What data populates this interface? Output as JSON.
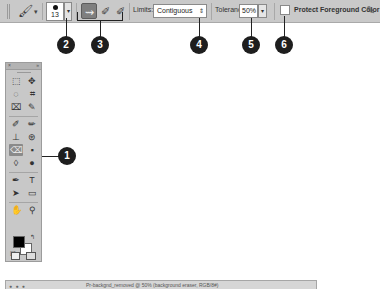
{
  "options_bar": {
    "tool_preset_icon": "background-eraser-icon",
    "tool_preset_arrow": "▾",
    "brush": {
      "size": "13",
      "dropdown": "▾"
    },
    "sampling_buttons": [
      {
        "name": "sampling-continuous",
        "glyph": "⇝",
        "active": true
      },
      {
        "name": "sampling-once",
        "glyph": "✐",
        "active": false
      },
      {
        "name": "sampling-background-swatch",
        "glyph": "✐",
        "active": false
      }
    ],
    "limits_label": "Limits:",
    "limits_value": "Contiguous",
    "limits_arrows": "⇕",
    "tolerance_label": "Tolerance:",
    "tolerance_value": "50%",
    "tolerance_dropdown": "▾",
    "protect_fg_label": "Protect Foreground Color",
    "protect_fg_checked": false,
    "tablet_pressure_icon": "✎"
  },
  "callouts": [
    "1",
    "2",
    "3",
    "4",
    "5",
    "6"
  ],
  "toolbox": {
    "title_close": "×",
    "title_collapse": "»",
    "rows": [
      [
        "⬚",
        "✥"
      ],
      [
        "◌",
        "⌗"
      ],
      [
        "⌧",
        "✎"
      ],
      [
        "✐",
        "✏"
      ],
      [
        "⊥",
        "⊛"
      ],
      [
        "⌫",
        "▪"
      ],
      [
        "◊",
        "●"
      ],
      [
        "✒",
        "T"
      ],
      [
        "➤",
        "▭"
      ],
      [
        "✋",
        "⚲"
      ]
    ],
    "swap_glyph": "↰",
    "default_glyph": "◪"
  },
  "document": {
    "lights": "● ● ●",
    "title": "Pr-backgnd_removed @ 50% (background eraser, RGB/8#)"
  },
  "colors": {
    "optbar_bg": "#c9c9c9",
    "toolbox_bg": "#c8c8c8",
    "callout_bg": "#1e1e1e",
    "foreground": "#000000",
    "background": "#ffffff"
  }
}
